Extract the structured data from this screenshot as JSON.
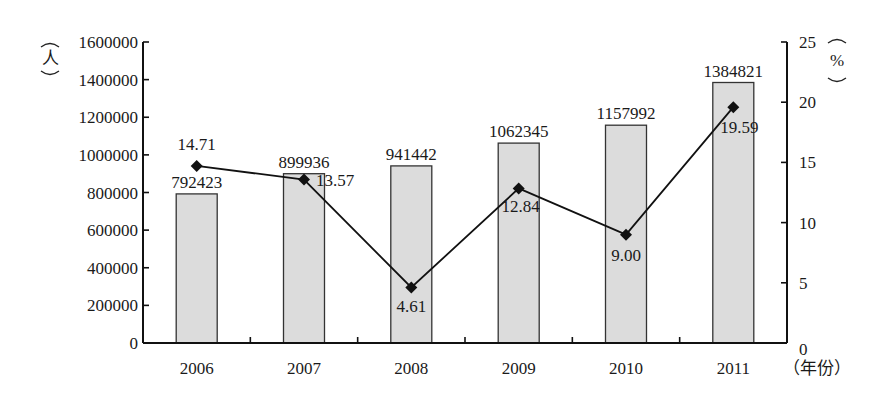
{
  "chart_data": {
    "type": "bar+line",
    "title": "",
    "categories": [
      "2006",
      "2007",
      "2008",
      "2009",
      "2010",
      "2011"
    ],
    "series": [
      {
        "name": "人数",
        "type": "bar",
        "axis": "left",
        "values": [
          792423,
          899936,
          941442,
          1062345,
          1157992,
          1384821
        ],
        "labels": [
          "792423",
          "899936",
          "941442",
          "1062345",
          "1157992",
          "1384821"
        ]
      },
      {
        "name": "增长率",
        "type": "line",
        "axis": "right",
        "marker": "diamond",
        "values": [
          14.71,
          13.57,
          4.61,
          12.84,
          9.0,
          19.59
        ],
        "labels": [
          "14.71",
          "13.57",
          "4.61",
          "12.84",
          "9.00",
          "19.59"
        ]
      }
    ],
    "xlabel": "（年份）",
    "ylabel_left": "（人）",
    "ylabel_right": "（%）",
    "ylim_left": [
      0,
      1600000
    ],
    "yticks_left": [
      "0",
      "200000",
      "400000",
      "600000",
      "800000",
      "1000000",
      "1200000",
      "1400000",
      "1600000"
    ],
    "ylim_right": [
      0,
      25
    ],
    "yticks_right": [
      "0",
      "5",
      "10",
      "15",
      "20",
      "25"
    ],
    "grid": false,
    "legend": "none",
    "colors": {
      "bar_fill": "#dcdcdc",
      "bar_stroke": "#333333",
      "line": "#111111",
      "axis": "#111111"
    }
  },
  "labels": {
    "left_unit": "人",
    "right_unit": "%",
    "x_unit": "（年份）"
  }
}
